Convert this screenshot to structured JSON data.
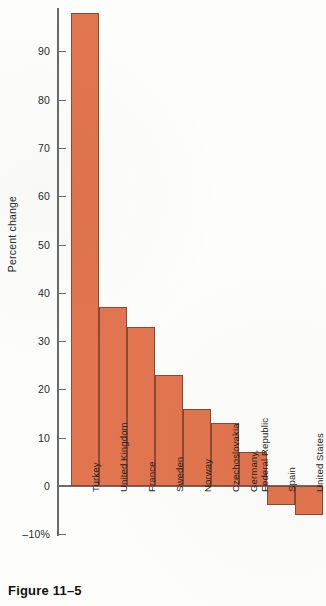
{
  "figure": {
    "caption": "Figure 11–5"
  },
  "chart_data": {
    "type": "bar",
    "title": "",
    "subtitle": "",
    "xlabel": "",
    "ylabel": "Percent change",
    "categories": [
      "Turkey",
      "United Kingdom",
      "France",
      "Sweden",
      "Norway",
      "Czechoslovakia",
      "Germany,\nFederal Republic",
      "Spain",
      "United States"
    ],
    "values": [
      98,
      37,
      33,
      23,
      16,
      13,
      7,
      -4,
      -6
    ],
    "ylim": [
      -10,
      98
    ],
    "ytick_values": [
      90,
      80,
      70,
      60,
      50,
      40,
      30,
      20,
      10,
      0,
      -10
    ],
    "ytick_labels": [
      "90",
      "80",
      "70",
      "60",
      "50",
      "40",
      "30",
      "20",
      "10",
      "0",
      "–10%"
    ],
    "grid": false,
    "legend": null,
    "bar_color": "#e1754f",
    "bar_edge_color": "#8a4a33",
    "axis_color": "#6a6a6a"
  }
}
